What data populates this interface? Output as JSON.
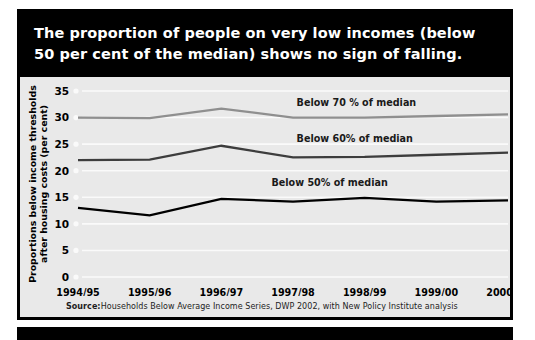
{
  "figure": {
    "title_lines": [
      "The proportion of people on very low incomes (below",
      "50 per cent of the median) shows no sign of falling."
    ],
    "source_prefix": "Source:",
    "source_text": " Households Below Average Income Series, DWP 2002, with New Policy Institute analysis",
    "colors": {
      "title_background": "#000000",
      "title_text": "#ffffff",
      "plot_background": "#e9e9e9",
      "gridline": "#fafafa",
      "border": "#000000"
    }
  },
  "chart_data": {
    "type": "line",
    "title": "The proportion of people on very low incomes (below 50 per cent of the median) shows no sign of falling.",
    "xlabel": "",
    "ylabel": "Proportions below income thresholds after housing costs (per cent)",
    "ylabel_lines": [
      "Proportions below income thresholds",
      "after housing costs (per cent)"
    ],
    "categories": [
      "1994/95",
      "1995/96",
      "1996/97",
      "1997/98",
      "1998/99",
      "1999/00",
      "2000/01"
    ],
    "ylim": [
      0,
      35
    ],
    "yticks": [
      0,
      5,
      10,
      15,
      20,
      25,
      30,
      35
    ],
    "grid": true,
    "legend_position": "inline-labels",
    "series": [
      {
        "name": "Below 70 % of median",
        "color": "#8f8f8f",
        "label_x_index": 3.05,
        "label_y": 32.2,
        "values": [
          30.0,
          29.9,
          31.7,
          30.0,
          30.0,
          30.3,
          30.6
        ]
      },
      {
        "name": "Below 60% of median",
        "color": "#3d3d3d",
        "label_x_index": 3.05,
        "label_y": 25.4,
        "values": [
          22.0,
          22.1,
          24.7,
          22.5,
          22.6,
          23.0,
          23.4
        ]
      },
      {
        "name": "Below 50% of median",
        "color": "#000000",
        "label_x_index": 2.7,
        "label_y": 17.2,
        "values": [
          13.0,
          11.6,
          14.7,
          14.2,
          14.9,
          14.2,
          14.4
        ]
      }
    ]
  }
}
